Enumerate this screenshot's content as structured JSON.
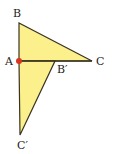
{
  "figure": {
    "fill_color": "#fbf08c",
    "stroke_color": "#3a3320",
    "point_color": "#d9341f",
    "triangles": [
      {
        "name": "ABC",
        "vertices": [
          "A",
          "B",
          "C"
        ]
      },
      {
        "name": "AB'C'",
        "vertices": [
          "A",
          "B'",
          "C'"
        ]
      }
    ],
    "labels": {
      "A": "A",
      "B": "B",
      "C": "C",
      "B_prime": "B′",
      "C_prime": "C′"
    },
    "marked_point": "A"
  }
}
